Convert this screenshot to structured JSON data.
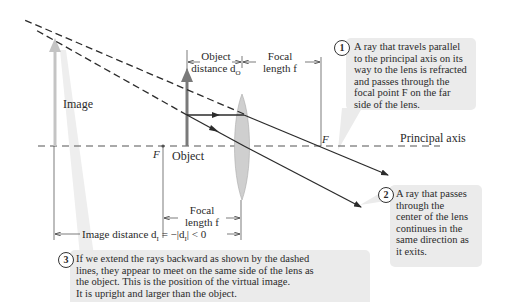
{
  "diagram": {
    "colors": {
      "ray": "#2b2b2b",
      "object_arrow": "#7a7a7a",
      "image_arrow": "#c4c4c4",
      "lens_fill": "#cfcfcf",
      "callout_bg": "#ebebeb",
      "axis": "#555555"
    },
    "labels": {
      "image": "Image",
      "object": "Object",
      "principal_axis": "Principal axis",
      "focal_point_left": "F",
      "focal_point_right": "F",
      "object_distance_line1": "Object",
      "object_distance_line2": "distance d",
      "object_distance_sub": "O",
      "focal_length_top_line1": "Focal",
      "focal_length_top_line2": "length f",
      "focal_length_bottom_line1": "Focal",
      "focal_length_bottom_line2": "length f",
      "image_distance": "Image distance d",
      "image_distance_sub": "I",
      "image_distance_eq": " = −|d",
      "image_distance_sub2": "I",
      "image_distance_tail": "| < 0"
    },
    "callouts": [
      {
        "number": "1",
        "text": "A ray that travels parallel\nto the principal axis on its\nway to the lens is refracted\nand passes through the\nfocal point F on the far\nside of the lens."
      },
      {
        "number": "2",
        "text": "A ray that passes\nthrough the\ncenter of the lens\ncontinues in the\nsame direction as\nit exits."
      },
      {
        "number": "3",
        "text": "If we extend the rays backward as shown by the dashed\nlines, they appear to meet on the same side of the lens as\nthe object. This is the position of the virtual image.\nIt is upright and larger than the object."
      }
    ]
  }
}
